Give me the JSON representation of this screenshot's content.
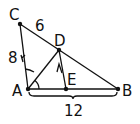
{
  "diagram": {
    "type": "geometry-triangle",
    "points": {
      "C": {
        "label": "C",
        "x": 20,
        "y": 24
      },
      "D": {
        "label": "D",
        "x": 59,
        "y": 50
      },
      "A": {
        "label": "A",
        "x": 28,
        "y": 89
      },
      "E": {
        "label": "E",
        "x": 66,
        "y": 89
      },
      "B": {
        "label": "B",
        "x": 118,
        "y": 89
      }
    },
    "segments": [
      {
        "from": "C",
        "to": "A"
      },
      {
        "from": "C",
        "to": "B"
      },
      {
        "from": "A",
        "to": "B"
      },
      {
        "from": "A",
        "to": "D"
      },
      {
        "from": "D",
        "to": "E"
      }
    ],
    "measurements": {
      "CD": "6",
      "AC": "8",
      "AB": "12"
    },
    "stroke_color": "#111111"
  }
}
